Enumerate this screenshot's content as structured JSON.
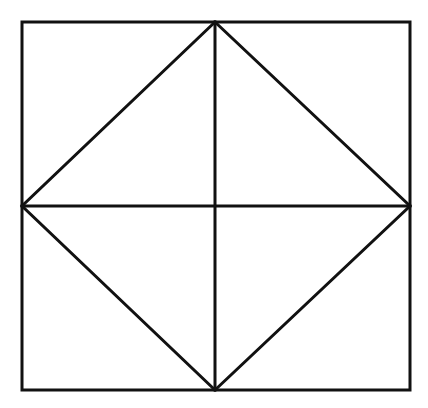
{
  "canvas": {
    "width": 428,
    "height": 408,
    "background_color": "#ffffff",
    "stroke_color": "#111111"
  },
  "figure": {
    "name": "square-with-inscribed-diamond-and-medians",
    "outer_square": {
      "label": "outer-square",
      "stroke_width": 3,
      "corners": {
        "top_left": [
          22,
          22
        ],
        "top_right": [
          410,
          22
        ],
        "bottom_right": [
          410,
          390
        ],
        "bottom_left": [
          22,
          390
        ]
      },
      "points": "22,22 410,22 410,390 22,390"
    },
    "inscribed_diamond": {
      "label": "inscribed-diamond",
      "stroke_width": 3,
      "vertices": {
        "top": [
          215,
          22
        ],
        "right": [
          410,
          206
        ],
        "bottom": [
          215,
          390
        ],
        "left": [
          22,
          206
        ]
      },
      "points": "215,22 410,206 215,390 22,206"
    },
    "vertical_median": {
      "label": "vertical-median-line",
      "stroke_width": 3,
      "x1": 215,
      "y1": 22,
      "x2": 215,
      "y2": 390
    },
    "horizontal_median": {
      "label": "horizontal-median-line",
      "stroke_width": 3,
      "x1": 22,
      "y1": 206,
      "x2": 410,
      "y2": 206
    },
    "center_point": [
      215,
      206
    ]
  }
}
